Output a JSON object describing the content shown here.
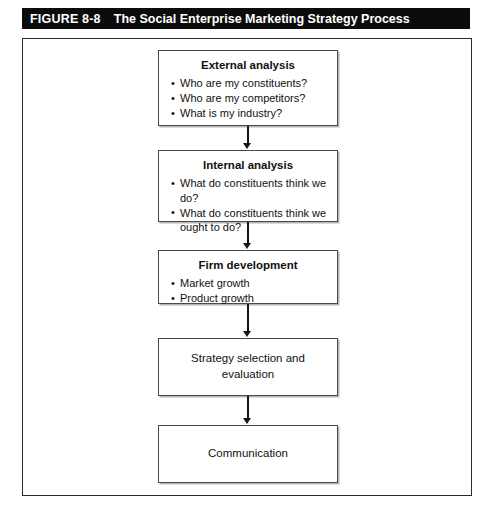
{
  "figure": {
    "label": "FIGURE 8-8",
    "title": "The Social Enterprise Marketing Strategy Process"
  },
  "diagram": {
    "type": "flowchart",
    "orientation": "vertical",
    "nodes": [
      {
        "id": "external-analysis",
        "heading": "External analysis",
        "bullets": [
          "Who are my constituents?",
          "Who are my competitors?",
          "What is my industry?"
        ]
      },
      {
        "id": "internal-analysis",
        "heading": "Internal analysis",
        "bullets": [
          "What do constituents think we do?",
          "What do constituents think we ought to do?"
        ]
      },
      {
        "id": "firm-development",
        "heading": "Firm development",
        "bullets": [
          "Market growth",
          "Product growth"
        ]
      },
      {
        "id": "strategy-selection-and-evaluation",
        "heading": "Strategy selection and evaluation",
        "bullets": []
      },
      {
        "id": "communication",
        "heading": "Communication",
        "bullets": []
      }
    ],
    "connectors": [
      {
        "from": "external-analysis",
        "to": "internal-analysis",
        "marker": "arrow-down"
      },
      {
        "from": "internal-analysis",
        "to": "firm-development",
        "marker": "arrow-down"
      },
      {
        "from": "firm-development",
        "to": "strategy-selection-and-evaluation",
        "marker": "arrow-down"
      },
      {
        "from": "strategy-selection-and-evaluation",
        "to": "communication",
        "marker": "arrow-down"
      }
    ]
  },
  "colors": {
    "title_bar_background": "#0c0c0c",
    "title_bar_text": "#ffffff",
    "frame_border": "#2b2b2b",
    "node_border": "#4a4a4a",
    "node_background": "#ffffff",
    "connector": "#161616",
    "body_text": "#111111",
    "page_background": "#ffffff"
  }
}
